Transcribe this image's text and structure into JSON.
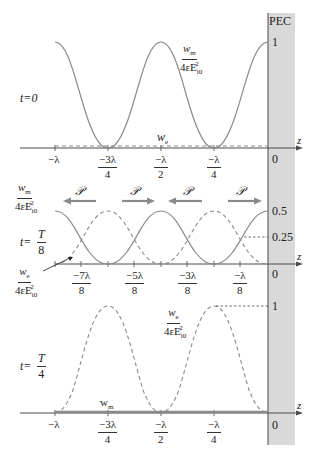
{
  "figure": {
    "pec_label": "PEC",
    "axis_label": "z",
    "colors": {
      "curve": "#8a8a8a",
      "axis": "#4a4a4a",
      "pec_fill": "#d9d9d9",
      "arrow": "#8a8a8a"
    }
  },
  "panel1": {
    "time_label": "t=0",
    "wm_label_num": "w",
    "wm_label_sub": "m",
    "wm_label_den": "4εE",
    "den_sub": "i0",
    "den_sup": "2",
    "we_label": "w",
    "we_sub": "e",
    "ytick_top": "1",
    "ytick_zero": "0",
    "xticks": [
      {
        "num": "−λ",
        "den": ""
      },
      {
        "num": "−3λ",
        "den": "4"
      },
      {
        "num": "−λ",
        "den": "2"
      },
      {
        "num": "−λ",
        "den": "4"
      }
    ]
  },
  "panel2": {
    "time_label_t": "t=",
    "time_label_num": "T",
    "time_label_den": "8",
    "wm_label_num": "w",
    "wm_label_sub": "m",
    "wm_label_den": "4εE",
    "we_label_num": "w",
    "we_label_sub": "e",
    "we_label_den": "4εE",
    "den_sub": "i0",
    "den_sup": "2",
    "ytick_half": "0.5",
    "ytick_quarter": "0.25",
    "ytick_zero": "0",
    "poynting_symbol": "𝒫",
    "arrows": [
      "left",
      "right",
      "left",
      "right"
    ],
    "xticks": [
      {
        "num": "−7λ",
        "den": "8"
      },
      {
        "num": "−5λ",
        "den": "8"
      },
      {
        "num": "−3λ",
        "den": "8"
      },
      {
        "num": "−λ",
        "den": "8"
      }
    ]
  },
  "panel3": {
    "time_label_t": "t=",
    "time_label_num": "T",
    "time_label_den": "4",
    "we_label_num": "w",
    "we_label_sub": "e",
    "we_label_den": "4εE",
    "den_sub": "i0",
    "den_sup": "2",
    "wm_label": "w",
    "wm_sub": "m",
    "ytick_top": "1",
    "ytick_zero": "0",
    "xticks": [
      {
        "num": "−λ",
        "den": ""
      },
      {
        "num": "−3λ",
        "den": "4"
      },
      {
        "num": "−λ",
        "den": "2"
      },
      {
        "num": "−λ",
        "den": "4"
      }
    ]
  }
}
